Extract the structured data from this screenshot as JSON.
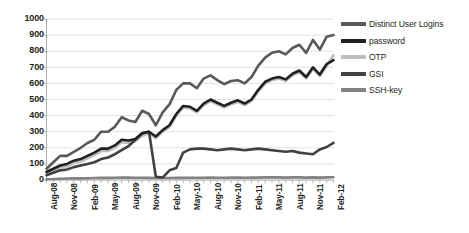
{
  "chart_data": {
    "type": "line",
    "title": "",
    "xlabel": "",
    "ylabel": "",
    "ylim": [
      0,
      1000
    ],
    "ytick_step": 100,
    "ytick_labels": [
      "1000",
      "900",
      "800",
      "700",
      "600",
      "500",
      "400",
      "300",
      "200",
      "100",
      "0"
    ],
    "grid": "horizontal",
    "legend_position": "right",
    "x_axis_tick_interval": "monthly",
    "x_axis_label_interval": "quarterly",
    "x_labels": [
      "Aug-08",
      "Nov-08",
      "Feb-09",
      "May-09",
      "Aug-09",
      "Nov-09",
      "Feb-10",
      "May-10",
      "Aug-10",
      "Nov-10",
      "Feb-11",
      "May-11",
      "Aug-11",
      "Nov-11",
      "Feb-12"
    ],
    "x": [
      "Aug-08",
      "Sep-08",
      "Oct-08",
      "Nov-08",
      "Dec-08",
      "Jan-09",
      "Feb-09",
      "Mar-09",
      "Apr-09",
      "May-09",
      "Jun-09",
      "Jul-09",
      "Aug-09",
      "Sep-09",
      "Oct-09",
      "Nov-09",
      "Dec-09",
      "Jan-10",
      "Feb-10",
      "Mar-10",
      "Apr-10",
      "May-10",
      "Jun-10",
      "Jul-10",
      "Aug-10",
      "Sep-10",
      "Oct-10",
      "Nov-10",
      "Dec-10",
      "Jan-11",
      "Feb-11",
      "Mar-11",
      "Apr-11",
      "May-11",
      "Jun-11",
      "Jul-11",
      "Aug-11",
      "Sep-11",
      "Oct-11",
      "Nov-11",
      "Dec-11",
      "Jan-12",
      "Feb-12"
    ],
    "series": [
      {
        "name": "Distinct User Logins",
        "color": "#58595b",
        "width": 2.6,
        "values": [
          70,
          110,
          150,
          150,
          175,
          200,
          230,
          250,
          300,
          300,
          330,
          390,
          370,
          360,
          430,
          410,
          340,
          420,
          470,
          560,
          600,
          600,
          570,
          630,
          650,
          620,
          595,
          615,
          620,
          600,
          640,
          710,
          760,
          790,
          800,
          780,
          820,
          840,
          790,
          870,
          810,
          890,
          900
        ]
      },
      {
        "name": "password",
        "color": "#231f20",
        "width": 2.6,
        "values": [
          50,
          70,
          90,
          100,
          120,
          130,
          150,
          170,
          195,
          195,
          215,
          250,
          245,
          255,
          290,
          300,
          270,
          310,
          340,
          410,
          460,
          455,
          430,
          475,
          500,
          480,
          460,
          480,
          495,
          475,
          500,
          560,
          610,
          630,
          640,
          625,
          660,
          680,
          640,
          700,
          655,
          720,
          745
        ]
      },
      {
        "name": "OTP",
        "color": "#bcbec0",
        "width": 2.6,
        "values": [
          40,
          60,
          80,
          85,
          105,
          115,
          135,
          155,
          180,
          180,
          200,
          235,
          230,
          240,
          275,
          290,
          260,
          300,
          330,
          400,
          450,
          445,
          420,
          465,
          490,
          470,
          450,
          470,
          485,
          465,
          490,
          550,
          600,
          620,
          630,
          615,
          650,
          670,
          630,
          690,
          645,
          710,
          775
        ]
      },
      {
        "name": "GSI",
        "color": "#414042",
        "width": 2.6,
        "values": [
          30,
          45,
          60,
          65,
          80,
          90,
          100,
          110,
          130,
          140,
          160,
          185,
          210,
          250,
          290,
          300,
          20,
          15,
          60,
          75,
          170,
          190,
          195,
          195,
          190,
          185,
          190,
          195,
          190,
          185,
          190,
          195,
          190,
          185,
          180,
          175,
          180,
          170,
          165,
          160,
          190,
          205,
          230
        ]
      },
      {
        "name": "SSH-key",
        "color": "#808285",
        "width": 2.6,
        "values": [
          5,
          6,
          8,
          9,
          10,
          10,
          11,
          12,
          13,
          13,
          14,
          15,
          15,
          14,
          14,
          13,
          12,
          12,
          12,
          13,
          13,
          14,
          14,
          14,
          15,
          14,
          14,
          15,
          15,
          14,
          15,
          15,
          16,
          16,
          16,
          15,
          16,
          16,
          15,
          16,
          15,
          16,
          17
        ]
      }
    ]
  },
  "legend": {
    "items": [
      {
        "label": "Distinct User Logins",
        "color": "#58595b"
      },
      {
        "label": "password",
        "color": "#231f20"
      },
      {
        "label": "OTP",
        "color": "#bcbec0"
      },
      {
        "label": "GSI",
        "color": "#414042"
      },
      {
        "label": "SSH-key",
        "color": "#808285"
      }
    ]
  },
  "axis": {
    "gridline_color": "#d9d9d9",
    "axis_color": "#a6a6a6"
  }
}
